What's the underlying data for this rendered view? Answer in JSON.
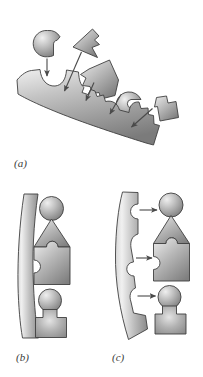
{
  "figure": {
    "type": "scientific-diagram",
    "background_color": "#ffffff",
    "outline_color": "#3f3f3f",
    "fill_light": "#e2e2e2",
    "fill_mid": "#b8b8b8",
    "fill_dark": "#8a8a8a",
    "fill_darkest": "#6e6e6e",
    "arrow_color": "#555555",
    "label_color": "#3a3a3a"
  },
  "panels": [
    {
      "id": "a",
      "label": "(a)",
      "caption_text": "(a)",
      "content_summary": "A long curved bar (receptor) lies diagonally with four concave notches along its upper edge. Four separate free-floating shapes float above it, each matching one notch, with thin arrows pointing from each shape down into its matching notch.",
      "receptor": {
        "name": "curved-receptor-bar",
        "orientation": "diagonal descending left-to-right",
        "notch_count": 4,
        "notch_shapes": [
          "round-concave",
          "square-concave",
          "round-concave",
          "square-concave"
        ]
      },
      "ligands": [
        {
          "name": "notched-sphere-ligand",
          "shape": "circle-with-bite",
          "position": "upper-left"
        },
        {
          "name": "arrowhead-ligand",
          "shape": "triangular-arrowhead",
          "position": "top-center"
        },
        {
          "name": "puzzle-square-ligand",
          "shape": "irregular-square-with-tabs",
          "position": "center"
        },
        {
          "name": "sphere-with-slot-ligand",
          "shape": "circle-with-slot",
          "position": "center-right"
        },
        {
          "name": "t-block-ligand",
          "shape": "stepped-block",
          "position": "right"
        }
      ],
      "arrows": [
        {
          "name": "binding-arrow-1",
          "from": "notched-sphere-ligand",
          "to": "notch-1"
        },
        {
          "name": "binding-arrow-2",
          "from": "arrowhead-ligand",
          "to": "notch-2"
        },
        {
          "name": "binding-arrow-3",
          "from": "puzzle-square-ligand",
          "to": "notch-3"
        },
        {
          "name": "binding-arrow-4",
          "from": "sphere-with-slot-ligand",
          "to": "notch-4"
        },
        {
          "name": "binding-arrow-5",
          "from": "t-block-ligand",
          "to": "notch-4"
        }
      ]
    },
    {
      "id": "b",
      "label": "(b)",
      "caption_text": "(b)",
      "content_summary": "A nearly straight vertical bar (smooth receptor) sits at the left. To its right a stacked column of four pieces (sphere, triangle, notched square, sphere and block) is aligned but unbound — the bar has no notches so nothing fits.",
      "receptor": {
        "name": "smooth-receptor-bar",
        "orientation": "vertical, slightly bowed",
        "notch_count": 0
      },
      "ligand_stack": [
        {
          "name": "sphere-piece",
          "shape": "circle"
        },
        {
          "name": "triangle-piece",
          "shape": "triangle-with-concave-base"
        },
        {
          "name": "puzzle-square-piece",
          "shape": "square-with-tab-and-socket"
        },
        {
          "name": "sphere-piece-lower",
          "shape": "circle"
        },
        {
          "name": "block-piece",
          "shape": "rectangular-block"
        }
      ],
      "arrows": []
    },
    {
      "id": "c",
      "label": "(c)",
      "caption_text": "(c)",
      "content_summary": "A strongly curved vertical bar bearing three concave notches on its right edge. Three horizontal arrows point from the notches across to the matching pieces of the stacked ligand column on the right, indicating complementary fit.",
      "receptor": {
        "name": "notched-curved-receptor-bar",
        "orientation": "vertical, strongly bowed",
        "notch_count": 3,
        "notch_shapes": [
          "round-concave",
          "pointed-concave",
          "round-concave"
        ]
      },
      "ligand_stack": [
        {
          "name": "sphere-piece",
          "shape": "circle"
        },
        {
          "name": "triangle-piece",
          "shape": "triangle-with-concave-base"
        },
        {
          "name": "puzzle-square-piece",
          "shape": "square-with-tab-and-socket"
        },
        {
          "name": "sphere-piece-lower",
          "shape": "circle"
        },
        {
          "name": "block-piece",
          "shape": "rectangular-block"
        }
      ],
      "arrows": [
        {
          "name": "fit-arrow-top",
          "direction": "left-to-right",
          "target": "sphere-piece"
        },
        {
          "name": "fit-arrow-middle",
          "direction": "left-to-right",
          "target": "puzzle-square-piece"
        },
        {
          "name": "fit-arrow-bottom",
          "direction": "left-to-right",
          "target": "sphere-piece-lower"
        }
      ]
    }
  ]
}
